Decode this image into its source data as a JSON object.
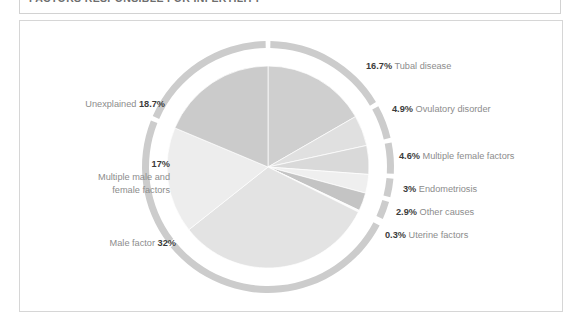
{
  "panel": {
    "title": "FACTORS RESPONSIBLE FOR INFERTILITY"
  },
  "colors": {
    "panel_border": "#d6d6d6",
    "title_border": "#d2d2d2",
    "label_text": "#8c8c8c",
    "value_text": "#3b3b3b",
    "ring_base": "#c9c9c9",
    "background": "#ffffff"
  },
  "labels": {
    "tubal_disease": {
      "value": "16.7%",
      "name": "Tubal disease"
    },
    "ovulatory_disorder": {
      "value": "4.9%",
      "name": "Ovulatory disorder"
    },
    "multiple_female_factors": {
      "value": "4.6%",
      "name": "Multiple female factors"
    },
    "endometriosis": {
      "value": "3%",
      "name": "Endometriosis"
    },
    "other_causes": {
      "value": "2.9%",
      "name": "Other causes"
    },
    "uterine_factors": {
      "value": "0.3%",
      "name": "Uterine factors"
    },
    "male_factor": {
      "value": "32%",
      "name": "Male factor"
    },
    "multiple_male_female": {
      "value": "17%",
      "line1": "Multiple male and",
      "line2": "female factors"
    },
    "unexplained": {
      "value": "18.7%",
      "name": "Unexplained"
    }
  },
  "chart_data": {
    "type": "pie",
    "title": "FACTORS RESPONSIBLE FOR INFERTILITY",
    "unit": "percent",
    "legend_position": "callout-labels",
    "categories": [
      "Tubal disease",
      "Ovulatory disorder",
      "Multiple female factors",
      "Endometriosis",
      "Other causes",
      "Uterine factors",
      "Male factor",
      "Multiple male and female factors",
      "Unexplained"
    ],
    "values": [
      16.7,
      4.9,
      4.6,
      3,
      2.9,
      0.3,
      32,
      17,
      18.7
    ],
    "slice_colors": [
      "#cfcfcf",
      "#e0e0e0",
      "#d9d9d9",
      "#efefef",
      "#c4c4c4",
      "#fbfbfb",
      "#e3e3e3",
      "#ededed",
      "#cbcbcb"
    ],
    "start_angle_deg": -90,
    "direction": "clockwise",
    "outer_ring": true,
    "outer_ring_color": "#cccccc",
    "outer_ring_gap_deg": 2.2
  }
}
